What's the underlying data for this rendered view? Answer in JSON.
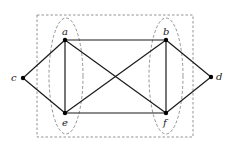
{
  "diagram": {
    "type": "graph",
    "nodes": [
      {
        "id": "a",
        "label": "a",
        "x": 65,
        "y": 40,
        "lx": 62,
        "ly": 35
      },
      {
        "id": "b",
        "label": "b",
        "x": 166,
        "y": 40,
        "lx": 163,
        "ly": 35
      },
      {
        "id": "c",
        "label": "c",
        "x": 23,
        "y": 78,
        "lx": 12,
        "ly": 81
      },
      {
        "id": "d",
        "label": "d",
        "x": 211,
        "y": 77,
        "lx": 216,
        "ly": 80
      },
      {
        "id": "e",
        "label": "e",
        "x": 65,
        "y": 113,
        "lx": 62,
        "ly": 125
      },
      {
        "id": "f",
        "label": "f",
        "x": 166,
        "y": 113,
        "lx": 163,
        "ly": 125
      }
    ],
    "edges": [
      [
        "a",
        "b"
      ],
      [
        "e",
        "f"
      ],
      [
        "a",
        "e"
      ],
      [
        "b",
        "f"
      ],
      [
        "a",
        "f"
      ],
      [
        "e",
        "b"
      ],
      [
        "c",
        "a"
      ],
      [
        "c",
        "e"
      ],
      [
        "d",
        "b"
      ],
      [
        "d",
        "f"
      ]
    ],
    "frame": {
      "x": 37,
      "y": 15,
      "w": 156,
      "h": 122,
      "style": "dashed"
    },
    "groups": [
      {
        "id": "left-group",
        "members": [
          "a",
          "e"
        ],
        "cx": 66,
        "cy": 76,
        "rx": 17,
        "ry": 58
      },
      {
        "id": "right-group",
        "members": [
          "b",
          "f"
        ],
        "cx": 166,
        "cy": 76,
        "rx": 17,
        "ry": 58
      }
    ]
  },
  "labels": {
    "a": "a",
    "b": "b",
    "c": "c",
    "d": "d",
    "e": "e",
    "f": "f"
  }
}
